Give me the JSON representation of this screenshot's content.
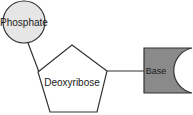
{
  "diagram": {
    "nodes": [
      {
        "id": "phosphate",
        "label": "Phosphate",
        "shape": "circle",
        "fill": "#e6e6e6"
      },
      {
        "id": "deoxyribose",
        "label": "Deoxyribose",
        "shape": "pentagon",
        "fill": "#ffffff"
      },
      {
        "id": "base",
        "label": "Base",
        "shape": "notched-rectangle",
        "fill": "#8a8a8a"
      }
    ],
    "edges": [
      {
        "from": "phosphate",
        "to": "deoxyribose"
      },
      {
        "from": "deoxyribose",
        "to": "base"
      }
    ],
    "stroke_color": "#333333"
  }
}
